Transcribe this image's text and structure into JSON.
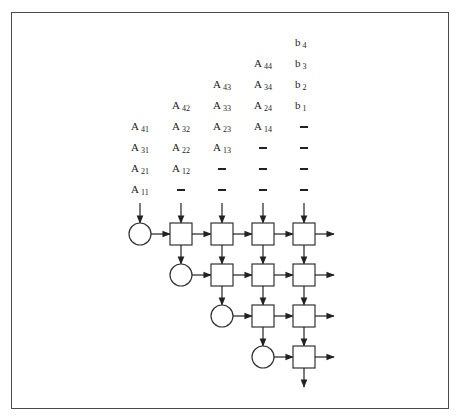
{
  "figure": {
    "frame_color": "#4a4a4a",
    "stroke_color": "#333333"
  },
  "input_columns": [
    {
      "x": 140,
      "items": [
        {
          "y": 193,
          "main": "A",
          "sub": "11"
        },
        {
          "y": 172,
          "main": "A",
          "sub": "21"
        },
        {
          "y": 151,
          "main": "A",
          "sub": "31"
        },
        {
          "y": 130,
          "main": "A",
          "sub": "41"
        }
      ]
    },
    {
      "x": 181,
      "items": [
        {
          "y": 193,
          "dash": true
        },
        {
          "y": 172,
          "main": "A",
          "sub": "12"
        },
        {
          "y": 151,
          "main": "A",
          "sub": "22"
        },
        {
          "y": 130,
          "main": "A",
          "sub": "32"
        },
        {
          "y": 109,
          "main": "A",
          "sub": "42"
        }
      ]
    },
    {
      "x": 222,
      "items": [
        {
          "y": 193,
          "dash": true
        },
        {
          "y": 172,
          "dash": true
        },
        {
          "y": 151,
          "main": "A",
          "sub": "13"
        },
        {
          "y": 130,
          "main": "A",
          "sub": "23"
        },
        {
          "y": 109,
          "main": "A",
          "sub": "33"
        },
        {
          "y": 88,
          "main": "A",
          "sub": "43"
        }
      ]
    },
    {
      "x": 263,
      "items": [
        {
          "y": 193,
          "dash": true
        },
        {
          "y": 172,
          "dash": true
        },
        {
          "y": 151,
          "dash": true
        },
        {
          "y": 130,
          "main": "A",
          "sub": "14"
        },
        {
          "y": 109,
          "main": "A",
          "sub": "24"
        },
        {
          "y": 88,
          "main": "A",
          "sub": "34"
        },
        {
          "y": 67,
          "main": "A",
          "sub": "44"
        }
      ]
    },
    {
      "x": 304,
      "items": [
        {
          "y": 193,
          "dash": true
        },
        {
          "y": 172,
          "dash": true
        },
        {
          "y": 151,
          "dash": true
        },
        {
          "y": 130,
          "dash": true
        },
        {
          "y": 109,
          "main": "b",
          "sub": "1"
        },
        {
          "y": 88,
          "main": "b",
          "sub": "2"
        },
        {
          "y": 67,
          "main": "b",
          "sub": "3"
        },
        {
          "y": 46,
          "main": "b",
          "sub": "4"
        }
      ]
    }
  ],
  "array": {
    "col_x": [
      140,
      181,
      222,
      263,
      304
    ],
    "row_y": [
      234,
      275,
      316,
      357
    ],
    "cell_size": 22,
    "circle_r": 11,
    "input_arrow_top": 203,
    "output_arrow_end": 334,
    "bottom_arrow_end": 387,
    "rows": [
      {
        "circle_col": 0,
        "square_cols": [
          1,
          2,
          3,
          4
        ]
      },
      {
        "circle_col": 1,
        "square_cols": [
          2,
          3,
          4
        ]
      },
      {
        "circle_col": 2,
        "square_cols": [
          3,
          4
        ]
      },
      {
        "circle_col": 3,
        "square_cols": [
          4
        ]
      }
    ],
    "cell_types": {
      "circle": "boundary-cell",
      "square": "internal-cell"
    }
  }
}
